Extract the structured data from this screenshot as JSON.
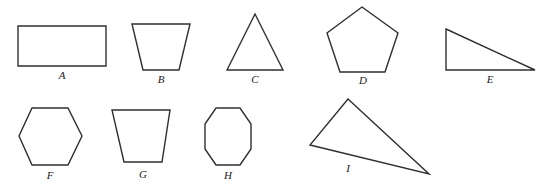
{
  "figure": {
    "background_color": "#ffffff",
    "stroke_color": "#2f2f2f",
    "label_color": "#1a1a1a",
    "width": 552,
    "height": 190,
    "shapes": [
      {
        "label": "A",
        "name": "rectangle",
        "points": "18,26 106,26 106,66 18,66",
        "label_x": 62,
        "label_y": 79
      },
      {
        "label": "B",
        "name": "trapezoid-narrow-bottom",
        "points": "132,24 190,24 179,70 143,70",
        "label_x": 161,
        "label_y": 83
      },
      {
        "label": "C",
        "name": "triangle-isosceles",
        "points": "255,14 283,70 227,70",
        "label_x": 255,
        "label_y": 83
      },
      {
        "label": "D",
        "name": "pentagon",
        "points": "362,7 398,33 385,72 340,72 327,33",
        "label_x": 363,
        "label_y": 84
      },
      {
        "label": "E",
        "name": "right-triangle",
        "points": "446,29 535,70 446,70",
        "label_x": 490,
        "label_y": 83
      },
      {
        "label": "F",
        "name": "hexagon",
        "points": "32,108 68,108 82,136 68,165 32,165 19,136",
        "label_x": 50,
        "label_y": 179
      },
      {
        "label": "G",
        "name": "trapezoid-narrow-bottom",
        "points": "112,110 170,110 162,162 124,162",
        "label_x": 143,
        "label_y": 178
      },
      {
        "label": "H",
        "name": "octagon",
        "points": "216,108 240,108 251,124 251,149 240,165 216,165 205,149 205,124",
        "label_x": 228,
        "label_y": 179
      },
      {
        "label": "I",
        "name": "triangle-scalene-obtuse",
        "points": "348,99 429,174 310,145",
        "label_x": 348,
        "label_y": 172
      }
    ]
  }
}
